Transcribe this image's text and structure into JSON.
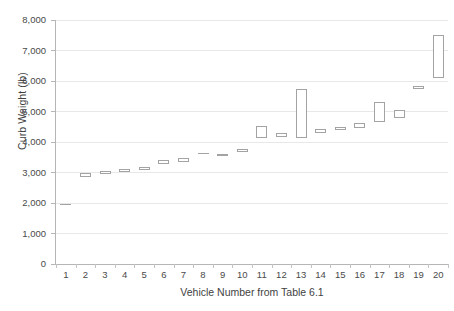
{
  "chart_data": {
    "type": "bar",
    "subtype": "floating-range-bar",
    "title": "",
    "xlabel": "Vehicle Number from Table 6.1",
    "ylabel": "Curb Weight (lb)",
    "xlim": [
      0.5,
      20.5
    ],
    "ylim": [
      0,
      8000
    ],
    "ytick_step": 1000,
    "grid": true,
    "legend": false,
    "marker_style": "open white rectangle with gray outline",
    "ytick_labels": [
      "0",
      "1,000",
      "2,000",
      "3,000",
      "4,000",
      "5,000",
      "6,000",
      "7,000",
      "8,000"
    ],
    "ytick_values": [
      0,
      1000,
      2000,
      3000,
      4000,
      5000,
      6000,
      7000,
      8000
    ],
    "categories": [
      "1",
      "2",
      "3",
      "4",
      "5",
      "6",
      "7",
      "8",
      "9",
      "10",
      "11",
      "12",
      "13",
      "14",
      "15",
      "16",
      "17",
      "18",
      "19",
      "20"
    ],
    "series": [
      {
        "name": "Curb Weight Range (lb)",
        "low": [
          1950,
          2840,
          2940,
          3010,
          3080,
          3290,
          3340,
          3620,
          3540,
          3670,
          4120,
          4150,
          4130,
          4300,
          4400,
          4470,
          4650,
          4800,
          5730,
          6100
        ],
        "high": [
          1950,
          2970,
          3060,
          3110,
          3180,
          3410,
          3480,
          3620,
          3620,
          3780,
          4520,
          4290,
          5740,
          4420,
          4500,
          4620,
          5300,
          5060,
          5830,
          7510
        ]
      }
    ]
  }
}
